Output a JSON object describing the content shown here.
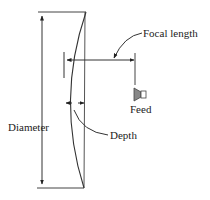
{
  "diagram": {
    "labels": {
      "focal_length": "Focal length",
      "feed": "Feed",
      "diameter": "Diameter",
      "depth": "Depth"
    },
    "colors": {
      "line": "#333333",
      "feed_fill": "#888888",
      "background": "#ffffff"
    },
    "icons": {
      "feed": "feed-horn-icon"
    }
  }
}
